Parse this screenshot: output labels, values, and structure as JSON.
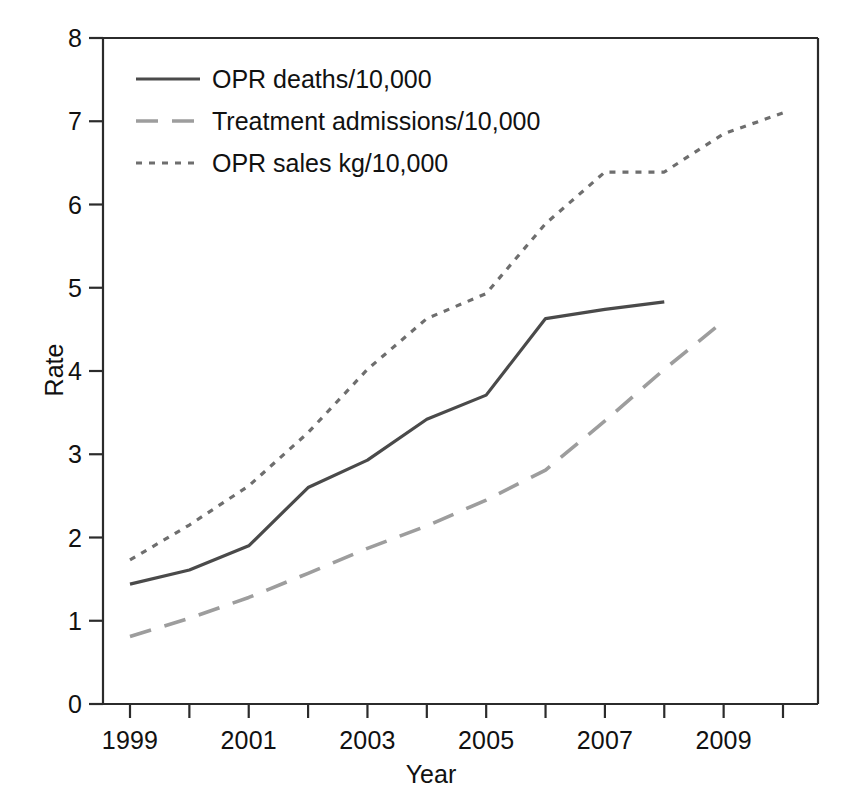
{
  "chart_data": {
    "type": "line",
    "title": "",
    "subtitle": "",
    "xlabel": "Year",
    "ylabel": "Rate",
    "xlim": [
      1999,
      2010
    ],
    "ylim": [
      0,
      8
    ],
    "grid": false,
    "legend_position": "top-left",
    "x_tick_values": [
      1999,
      2000,
      2001,
      2002,
      2003,
      2004,
      2005,
      2006,
      2007,
      2008,
      2009,
      2010
    ],
    "x_tick_labels": [
      "1999",
      "",
      "2001",
      "",
      "2003",
      "",
      "2005",
      "",
      "2007",
      "",
      "2009",
      ""
    ],
    "y_tick_values": [
      0,
      1,
      2,
      3,
      4,
      5,
      6,
      7,
      8
    ],
    "y_tick_labels": [
      "0",
      "1",
      "2",
      "3",
      "4",
      "5",
      "6",
      "7",
      "8"
    ],
    "series": [
      {
        "name": "OPR deaths/10,000",
        "style": "solid",
        "color": "#4a4a4a",
        "x": [
          1999,
          2000,
          2001,
          2002,
          2003,
          2004,
          2005,
          2006,
          2007,
          2008
        ],
        "values": [
          1.44,
          1.61,
          1.9,
          2.6,
          2.93,
          3.42,
          3.71,
          4.63,
          4.74,
          4.83
        ]
      },
      {
        "name": "Treatment admissions/10,000",
        "style": "dashed",
        "color": "#9d9d9d",
        "x": [
          1999,
          2000,
          2001,
          2002,
          2003,
          2004,
          2005,
          2006,
          2007,
          2008,
          2009
        ],
        "values": [
          0.81,
          1.03,
          1.28,
          1.57,
          1.87,
          2.14,
          2.45,
          2.81,
          3.4,
          4.02,
          4.6
        ]
      },
      {
        "name": "OPR sales kg/10,000",
        "style": "dotted",
        "color": "#6e6e6e",
        "x": [
          1999,
          2000,
          2001,
          2002,
          2003,
          2004,
          2005,
          2006,
          2007,
          2008,
          2009,
          2010
        ],
        "values": [
          1.73,
          2.15,
          2.62,
          3.26,
          4.02,
          4.63,
          4.93,
          5.77,
          6.39,
          6.39,
          6.85,
          7.1
        ]
      }
    ]
  },
  "axes": {
    "x_title": "Year",
    "y_title": "Rate"
  },
  "legend": {
    "items": [
      {
        "label": "OPR deaths/10,000"
      },
      {
        "label": "Treatment admissions/10,000"
      },
      {
        "label": "OPR sales kg/10,000"
      }
    ]
  }
}
